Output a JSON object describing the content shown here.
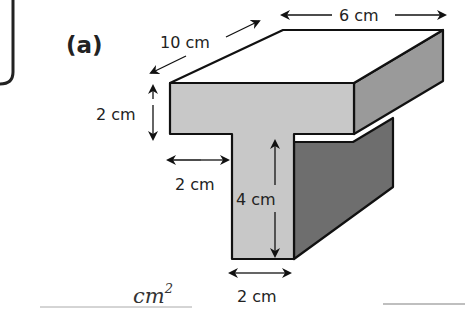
{
  "figure": {
    "part_label": "(a)",
    "shape": "T-shaped prism",
    "dimensions": {
      "depth": "10 cm",
      "top_width": "6 cm",
      "top_thickness": "2 cm",
      "left_overhang": "2 cm",
      "stem_height": "4 cm",
      "stem_width": "2 cm"
    }
  },
  "answer": {
    "unit": "cm",
    "exponent": "2",
    "line_right": ""
  },
  "colors": {
    "top_face": "#ffffff",
    "front_face": "#c8c8c8",
    "side_face_light": "#9a9a9a",
    "side_face_dark": "#6e6e6e",
    "outline": "#111111",
    "answer_line": "#aaaaaa"
  }
}
